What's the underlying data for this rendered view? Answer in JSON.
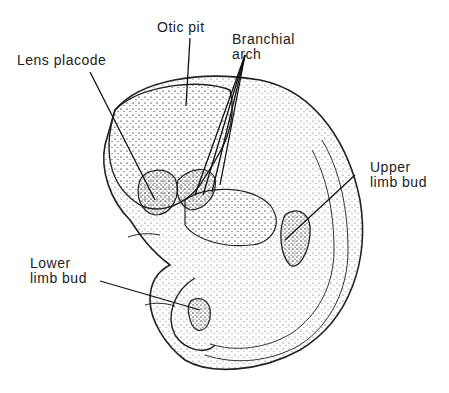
{
  "diagram": {
    "labels": {
      "lens_placode": "Lens placode",
      "otic_pit": "Otic pit",
      "branchial_arch": "Branchial\n  arch",
      "upper_limb_bud": "Upper\nlimb bud",
      "lower_limb_bud": "Lower\nlimb bud"
    },
    "colors": {
      "ink": "#222222",
      "background": "#ffffff"
    }
  }
}
